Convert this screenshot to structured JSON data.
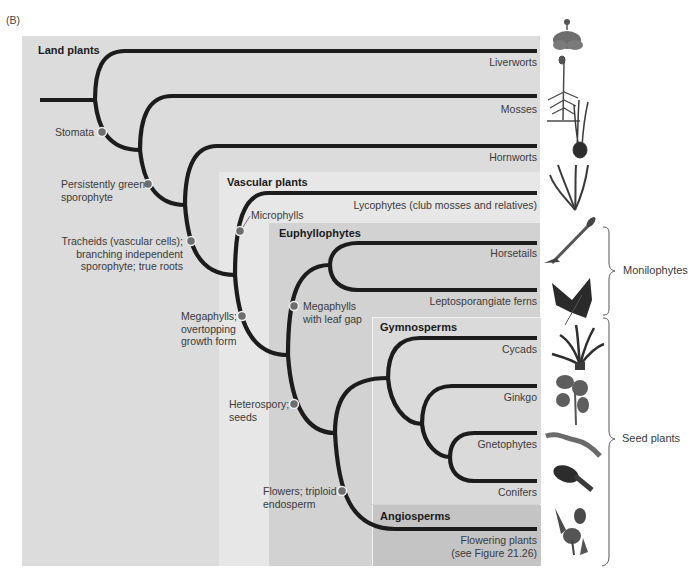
{
  "figure": {
    "panel_letter": "(B)"
  },
  "clades": {
    "land_plants": "Land plants",
    "vascular_plants": "Vascular plants",
    "euphyllophytes": "Euphyllophytes",
    "gymnosperms": "Gymnosperms",
    "angiosperms": "Angiosperms"
  },
  "taxa": [
    {
      "id": "liverworts",
      "label": "Liverworts"
    },
    {
      "id": "mosses",
      "label": "Mosses"
    },
    {
      "id": "hornworts",
      "label": "Hornworts"
    },
    {
      "id": "lycophytes",
      "label": "Lycophytes (club mosses and relatives)"
    },
    {
      "id": "horsetails",
      "label": "Horsetails"
    },
    {
      "id": "leptosporangiate-ferns",
      "label": "Leptosporangiate ferns"
    },
    {
      "id": "cycads",
      "label": "Cycads"
    },
    {
      "id": "ginkgo",
      "label": "Ginkgo"
    },
    {
      "id": "gnetophytes",
      "label": "Gnetophytes"
    },
    {
      "id": "conifers",
      "label": "Conifers"
    },
    {
      "id": "flowering-plants",
      "label": "Flowering plants",
      "note": "(see Figure 21.26)"
    }
  ],
  "traits": [
    {
      "id": "stomata",
      "lines": [
        "Stomata"
      ]
    },
    {
      "id": "persistently-green-sporophyte",
      "lines": [
        "Persistently green",
        "sporophyte"
      ]
    },
    {
      "id": "tracheids",
      "lines": [
        "Tracheids (vascular cells);",
        "branching independent",
        "sporophyte; true roots"
      ]
    },
    {
      "id": "microphylls",
      "lines": [
        "Microphylls"
      ]
    },
    {
      "id": "megaphylls-overtopping",
      "lines": [
        "Megaphylls;",
        "overtopping",
        "growth form"
      ]
    },
    {
      "id": "megaphylls-leaf-gap",
      "lines": [
        "Megaphylls",
        "with leaf gap"
      ]
    },
    {
      "id": "heterospory-seeds",
      "lines": [
        "Heterospory;",
        "seeds"
      ]
    },
    {
      "id": "flowers-endosperm",
      "lines": [
        "Flowers; triploid",
        "endosperm"
      ]
    }
  ],
  "groups": {
    "monilophytes": "Monilophytes",
    "seed_plants": "Seed plants"
  },
  "colors": {
    "land_panel": "#dcdcdc",
    "vascular_panel": "#e7e7e7",
    "euphyllophyte_panel": "#d2d2d2",
    "gymnosperm_panel": "#dadada",
    "angiosperm_panel": "#c4c4c4",
    "branch": "#1c1c1c",
    "trait_dot": "#6e6e6e"
  }
}
